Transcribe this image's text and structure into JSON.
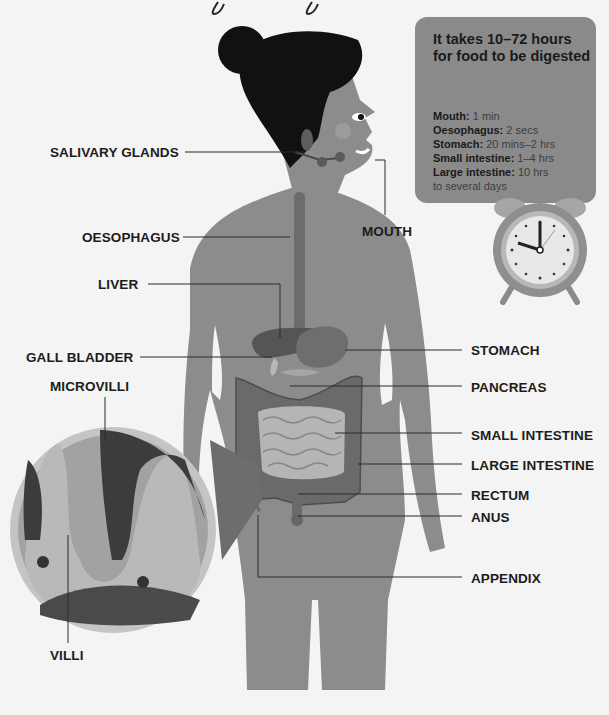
{
  "title_fragment": {
    "note": "cropped script title, only descenders visible"
  },
  "info_box": {
    "heading": "It takes 10–72 hours for food to be digested",
    "rows": [
      {
        "organ": "Mouth:",
        "time": " 1 min"
      },
      {
        "organ": "Oesophagus:",
        "time": " 2 secs"
      },
      {
        "organ": "Stomach:",
        "time": " 20 mins–2 hrs"
      },
      {
        "organ": "Small intestine:",
        "time": " 1–4 hrs"
      },
      {
        "organ": "Large intestine:",
        "time": " 10 hrs"
      },
      {
        "organ": "",
        "time": "to several days"
      }
    ]
  },
  "labels": {
    "salivary_glands": "SALIVARY GLANDS",
    "oesophagus": "OESOPHAGUS",
    "mouth": "MOUTH",
    "liver": "LIVER",
    "gall_bladder": "GALL BLADDER",
    "microvilli": "MICROVILLI",
    "villi": "VILLI",
    "stomach": "STOMACH",
    "pancreas": "PANCREAS",
    "small_intestine": "SMALL INTESTINE",
    "large_intestine": "LARGE INTESTINE",
    "rectum": "RECTUM",
    "anus": "ANUS",
    "appendix": "APPENDIX"
  },
  "clock": {
    "hour_hand": "approx 10",
    "minute_hand": "12"
  },
  "colors": {
    "background": "#f4f4f4",
    "body": "#8c8c8c",
    "hair": "#111111",
    "organs": "#6f6f6f",
    "intestine_light": "#b5b5b5",
    "info_box": "#8a8a8a",
    "text": "#1c1c1c"
  }
}
